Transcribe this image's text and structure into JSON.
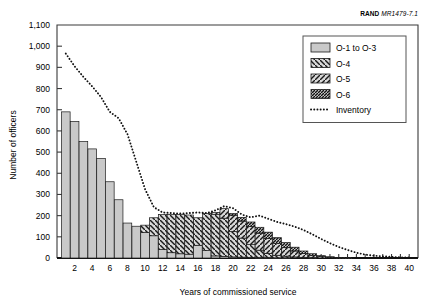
{
  "source_note": {
    "org": "RAND",
    "figure_id": "MR1479-7.1"
  },
  "chart_data": {
    "type": "bar",
    "title": "",
    "subtitle": "",
    "xlabel": "Years of commissioned service",
    "ylabel": "Number of officers",
    "xlim": [
      0,
      41
    ],
    "ylim": [
      0,
      1100
    ],
    "ytick_labels": [
      "0",
      "100",
      "200",
      "300",
      "400",
      "500",
      "600",
      "700",
      "800",
      "900",
      "1,000",
      "1,100"
    ],
    "yticks": [
      0,
      100,
      200,
      300,
      400,
      500,
      600,
      700,
      800,
      900,
      1000,
      1100
    ],
    "xtick_labels": [
      "2",
      "4",
      "6",
      "8",
      "10",
      "12",
      "14",
      "16",
      "18",
      "20",
      "22",
      "24",
      "26",
      "28",
      "30",
      "32",
      "34",
      "36",
      "38",
      "40"
    ],
    "xticks": [
      2,
      4,
      6,
      8,
      10,
      12,
      14,
      16,
      18,
      20,
      22,
      24,
      26,
      28,
      30,
      32,
      34,
      36,
      38,
      40
    ],
    "grid": false,
    "stacked": true,
    "legend_position": "top-right",
    "categories": [
      1,
      2,
      3,
      4,
      5,
      6,
      7,
      8,
      9,
      10,
      11,
      12,
      13,
      14,
      15,
      16,
      17,
      18,
      19,
      20,
      21,
      22,
      23,
      24,
      25,
      26,
      27,
      28,
      29,
      30,
      31,
      32,
      33,
      34,
      35,
      36,
      37,
      38,
      39,
      40
    ],
    "series": [
      {
        "name": "O-1 to O-3",
        "fill": "#c9c9c9",
        "pattern": "solid",
        "values": [
          690,
          645,
          550,
          515,
          470,
          360,
          275,
          165,
          150,
          120,
          105,
          40,
          25,
          20,
          18,
          60,
          35,
          10,
          8,
          5,
          4,
          3,
          2,
          2,
          1,
          1,
          0,
          0,
          0,
          0,
          0,
          0,
          0,
          0,
          0,
          0,
          0,
          0,
          0,
          0
        ]
      },
      {
        "name": "O-4",
        "fill": "#d0d0d0",
        "pattern": "hatch-backslash",
        "values": [
          0,
          0,
          0,
          0,
          0,
          0,
          0,
          0,
          0,
          35,
          85,
          165,
          180,
          185,
          185,
          130,
          175,
          195,
          180,
          120,
          90,
          60,
          35,
          20,
          12,
          8,
          5,
          3,
          2,
          0,
          0,
          0,
          0,
          0,
          0,
          0,
          0,
          0,
          0,
          0
        ]
      },
      {
        "name": "O-5",
        "fill": "#d0d0d0",
        "pattern": "hatch-slash",
        "values": [
          0,
          0,
          0,
          0,
          0,
          0,
          0,
          0,
          0,
          0,
          0,
          0,
          0,
          0,
          0,
          0,
          0,
          10,
          45,
          75,
          80,
          85,
          80,
          70,
          55,
          40,
          28,
          18,
          10,
          6,
          3,
          0,
          0,
          0,
          0,
          0,
          0,
          0,
          0,
          0
        ]
      },
      {
        "name": "O-6",
        "fill": "#c0c0c0",
        "pattern": "hatch-dense",
        "values": [
          0,
          0,
          0,
          0,
          0,
          0,
          0,
          0,
          0,
          0,
          0,
          0,
          0,
          0,
          0,
          0,
          0,
          0,
          0,
          10,
          18,
          22,
          28,
          30,
          28,
          24,
          18,
          12,
          8,
          5,
          3,
          2,
          1,
          0,
          0,
          0,
          0,
          0,
          0,
          0
        ]
      }
    ],
    "line_series": {
      "name": "Inventory",
      "style": "dotted",
      "color": "#111111",
      "x": [
        1,
        2,
        3,
        4,
        5,
        6,
        7,
        8,
        9,
        10,
        11,
        12,
        13,
        14,
        15,
        16,
        17,
        18,
        19,
        20,
        21,
        22,
        23,
        24,
        25,
        26,
        27,
        28,
        29,
        30,
        31,
        32,
        33,
        34,
        35,
        36,
        37,
        38,
        39,
        40
      ],
      "values": [
        965,
        905,
        855,
        810,
        760,
        690,
        660,
        585,
        455,
        325,
        240,
        215,
        212,
        210,
        212,
        215,
        212,
        225,
        245,
        235,
        205,
        192,
        200,
        185,
        170,
        160,
        148,
        132,
        112,
        90,
        70,
        52,
        38,
        25,
        16,
        11,
        8,
        5,
        3,
        2
      ]
    }
  },
  "legend": {
    "items": [
      {
        "label": "O-1 to O-3",
        "kind": "swatch",
        "pattern": "solid"
      },
      {
        "label": "O-4",
        "kind": "swatch",
        "pattern": "hatch-backslash"
      },
      {
        "label": "O-5",
        "kind": "swatch",
        "pattern": "hatch-slash"
      },
      {
        "label": "O-6",
        "kind": "swatch",
        "pattern": "hatch-dense"
      },
      {
        "label": "Inventory",
        "kind": "line",
        "pattern": "dotted"
      }
    ]
  }
}
